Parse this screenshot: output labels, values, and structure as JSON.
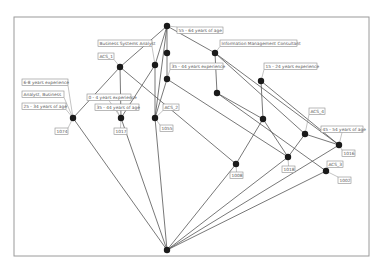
{
  "diagram": {
    "type": "concept-lattice",
    "frame": {
      "x": 14,
      "y": 17,
      "w": 355,
      "h": 239
    },
    "colors": {
      "node": "#1a1a1a",
      "edge": "#555555",
      "label_border": "#8a8a8a",
      "label_text": "#555555",
      "frame": "#9a9a9a"
    },
    "nodes": [
      {
        "id": "top",
        "x": 167,
        "y": 26
      },
      {
        "id": "n_age55",
        "x": 167,
        "y": 53
      },
      {
        "id": "n_imc",
        "x": 215,
        "y": 53
      },
      {
        "id": "n_acs1",
        "x": 120,
        "y": 67
      },
      {
        "id": "n_bsa",
        "x": 155,
        "y": 65
      },
      {
        "id": "n_exp35",
        "x": 167,
        "y": 79
      },
      {
        "id": "n_exp15",
        "x": 217,
        "y": 93
      },
      {
        "id": "n_imc_exp",
        "x": 261,
        "y": 81
      },
      {
        "id": "n_1074",
        "x": 73,
        "y": 118
      },
      {
        "id": "n_1017",
        "x": 121,
        "y": 118
      },
      {
        "id": "n_1055",
        "x": 155,
        "y": 118
      },
      {
        "id": "n_r1",
        "x": 263,
        "y": 119
      },
      {
        "id": "n_acs4",
        "x": 305,
        "y": 134
      },
      {
        "id": "n_1016",
        "x": 339,
        "y": 145
      },
      {
        "id": "n_1018",
        "x": 288,
        "y": 157
      },
      {
        "id": "n_1008",
        "x": 236,
        "y": 164
      },
      {
        "id": "n_1002",
        "x": 326,
        "y": 171
      },
      {
        "id": "bottom",
        "x": 167,
        "y": 250
      }
    ],
    "edges": [
      [
        "top",
        "n_acs1"
      ],
      [
        "top",
        "n_bsa"
      ],
      [
        "top",
        "n_age55"
      ],
      [
        "top",
        "n_imc"
      ],
      [
        "top",
        "n_1055"
      ],
      [
        "n_age55",
        "n_exp35"
      ],
      [
        "n_acs1",
        "n_1074"
      ],
      [
        "n_acs1",
        "n_1017"
      ],
      [
        "n_acs1",
        "n_1008"
      ],
      [
        "n_bsa",
        "n_1017"
      ],
      [
        "n_bsa",
        "n_1055"
      ],
      [
        "n_exp35",
        "n_1055"
      ],
      [
        "n_exp35",
        "n_1018"
      ],
      [
        "n_imc",
        "n_exp15"
      ],
      [
        "n_imc",
        "n_acs4"
      ],
      [
        "n_imc",
        "n_1016"
      ],
      [
        "n_exp15",
        "n_r1"
      ],
      [
        "n_exp15",
        "n_1002"
      ],
      [
        "n_imc_exp",
        "n_r1"
      ],
      [
        "n_imc_exp",
        "n_1016"
      ],
      [
        "n_r1",
        "n_1008"
      ],
      [
        "n_r1",
        "n_1018"
      ],
      [
        "n_acs4",
        "n_1016"
      ],
      [
        "n_acs4",
        "n_1018"
      ],
      [
        "bottom",
        "n_1074"
      ],
      [
        "bottom",
        "n_1017"
      ],
      [
        "bottom",
        "n_1055"
      ],
      [
        "bottom",
        "n_1008"
      ],
      [
        "bottom",
        "n_1018"
      ],
      [
        "bottom",
        "n_1016"
      ],
      [
        "bottom",
        "n_1002"
      ]
    ],
    "labels": [
      {
        "text": "55 - 64 years of age",
        "x": 177,
        "y": 27,
        "w": 46,
        "anchor": "top"
      },
      {
        "text": "Business Systems Analyst",
        "x": 98,
        "y": 40,
        "w": 54,
        "anchor": "n_bsa"
      },
      {
        "text": "Information Management Consultant",
        "x": 220,
        "y": 40,
        "w": 77,
        "anchor": "n_imc"
      },
      {
        "text": "ACS_1",
        "x": 98,
        "y": 53,
        "w": 16,
        "anchor": "n_acs1"
      },
      {
        "text": "35 - 44 years experience",
        "x": 170,
        "y": 63,
        "w": 53,
        "anchor": "n_exp35"
      },
      {
        "text": "15 - 24 years experience",
        "x": 264,
        "y": 63,
        "w": 53,
        "anchor": "n_imc_exp"
      },
      {
        "text": "6-8 years experience",
        "x": 22,
        "y": 79,
        "w": 46,
        "anchor": "n_1074"
      },
      {
        "text": "Analyst, Business",
        "x": 22,
        "y": 91,
        "w": 42,
        "anchor": "n_1074"
      },
      {
        "text": "25 - 34 years of age",
        "x": 22,
        "y": 103,
        "w": 44,
        "anchor": "n_1074"
      },
      {
        "text": "0 - 4 years experience",
        "x": 87,
        "y": 94,
        "w": 44,
        "anchor": "n_1017"
      },
      {
        "text": "35 - 44 years of age",
        "x": 95,
        "y": 104,
        "w": 44,
        "anchor": "n_1017"
      },
      {
        "text": "ACS_2",
        "x": 163,
        "y": 104,
        "w": 16,
        "anchor": "n_1055"
      },
      {
        "text": "ACS_4",
        "x": 309,
        "y": 108,
        "w": 16,
        "anchor": "n_acs4"
      },
      {
        "text": "45 - 54 years of age",
        "x": 321,
        "y": 126,
        "w": 42,
        "anchor": "n_1016"
      },
      {
        "text": "ACS_3",
        "x": 327,
        "y": 161,
        "w": 16,
        "anchor": "n_1002"
      },
      {
        "text": "1074",
        "x": 55,
        "y": 128,
        "w": 13,
        "anchor": "n_1074"
      },
      {
        "text": "1017",
        "x": 114,
        "y": 128,
        "w": 13,
        "anchor": "n_1017"
      },
      {
        "text": "1055",
        "x": 160,
        "y": 125,
        "w": 13,
        "anchor": "n_1055"
      },
      {
        "text": "1008",
        "x": 230,
        "y": 172,
        "w": 13,
        "anchor": "n_1008"
      },
      {
        "text": "1018",
        "x": 282,
        "y": 166,
        "w": 13,
        "anchor": "n_1018"
      },
      {
        "text": "1016",
        "x": 342,
        "y": 150,
        "w": 13,
        "anchor": "n_1016"
      },
      {
        "text": "1002",
        "x": 338,
        "y": 177,
        "w": 13,
        "anchor": "n_1002"
      }
    ]
  }
}
